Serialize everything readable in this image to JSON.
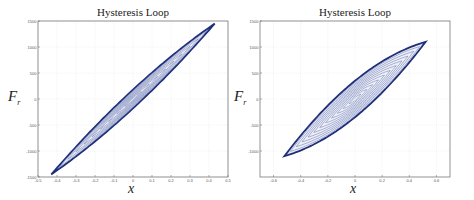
{
  "chart_data": [
    {
      "type": "line",
      "title": "Hysteresis Loop",
      "xlabel": "x",
      "ylabel": "F_r",
      "xlim": [
        -0.5,
        0.5
      ],
      "ylim": [
        -1500,
        1500
      ],
      "xticks": [
        -0.5,
        -0.4,
        -0.3,
        -0.2,
        -0.1,
        0,
        0.1,
        0.2,
        0.3,
        0.4,
        0.5
      ],
      "yticks": [
        -1500,
        -1000,
        -500,
        0,
        500,
        1000,
        1500
      ],
      "grid": true,
      "legend": null,
      "series": [
        {
          "name": "outer loop",
          "x_range": [
            -0.43,
            0.43
          ],
          "y_range": [
            -1450,
            1450
          ],
          "max_width_F": 360
        },
        {
          "name": "nested inner loops",
          "count": 10,
          "color": "#1f2f7a"
        }
      ],
      "tip_points": [
        [
          0.43,
          1450
        ],
        [
          -0.43,
          -1450
        ]
      ]
    },
    {
      "type": "line",
      "title": "Hysteresis Loop",
      "xlabel": "x",
      "ylabel": "F_r",
      "xlim": [
        -0.7,
        0.7
      ],
      "ylim": [
        -1500,
        1500
      ],
      "xticks": [
        -0.6,
        -0.4,
        -0.2,
        0,
        0.2,
        0.4,
        0.6
      ],
      "yticks": [
        -1000,
        -500,
        0,
        500,
        1000,
        1500
      ],
      "grid": true,
      "legend": null,
      "series": [
        {
          "name": "outer loop",
          "x_range": [
            -0.52,
            0.52
          ],
          "y_range": [
            -1100,
            1100
          ],
          "max_width_F": 700
        },
        {
          "name": "nested inner loops",
          "count": 12,
          "color": "#1f2f7a"
        }
      ],
      "tip_points": [
        [
          0.52,
          1100
        ],
        [
          -0.52,
          -1100
        ]
      ]
    }
  ],
  "panels": [
    {
      "title": "Hysteresis Loop",
      "xlabel": "x",
      "ylabel": "F",
      "ylabel_sub": "r"
    },
    {
      "title": "Hysteresis Loop",
      "xlabel": "x",
      "ylabel": "F",
      "ylabel_sub": "r"
    }
  ],
  "colors": {
    "loop": "#1f2f7a",
    "inner": "#5a6aa8",
    "grid": "#e4e4e4",
    "axis": "#666666"
  }
}
